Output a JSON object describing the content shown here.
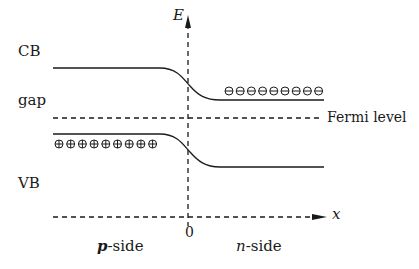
{
  "diagram": {
    "type": "pn-junction-band-diagram",
    "axes": {
      "vertical_label": "E",
      "horizontal_label": "x",
      "origin_label": "0"
    },
    "band_labels": {
      "conduction_band": "CB",
      "gap": "gap",
      "valence_band": "VB"
    },
    "fermi_level_label": "Fermi level",
    "region_labels": {
      "p_side_letter": "p",
      "p_side_suffix": "-side",
      "n_side_letter": "n",
      "n_side_suffix": "-side"
    },
    "carriers": {
      "holes": {
        "symbol": "⊕",
        "count": 9,
        "side": "p-side",
        "band": "VB"
      },
      "electrons": {
        "symbol": "⊖",
        "count": 9,
        "side": "n-side",
        "band": "CB"
      }
    },
    "colors": {
      "line": "#1a1a1a",
      "background": "#ffffff"
    }
  }
}
